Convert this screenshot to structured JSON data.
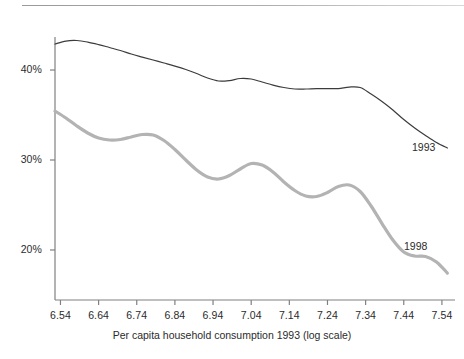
{
  "chart_data": {
    "type": "line",
    "title": "",
    "xlabel": "Per capita household consumption 1993 (log scale)",
    "ylabel": "",
    "xlim": [
      6.5257,
      7.5743
    ],
    "ylim": [
      0.1444,
      0.4367
    ],
    "grid": false,
    "legend": "inline-right",
    "y_tick_labels": [
      "40%",
      "30%",
      "20%"
    ],
    "y_tick_values": [
      0.4,
      0.3,
      0.2
    ],
    "x_tick_labels": [
      "6.54",
      "6.64",
      "6.74",
      "6.84",
      "6.94",
      "7.04",
      "7.14",
      "7.24",
      "7.34",
      "7.44",
      "7.54"
    ],
    "x_tick_values": [
      6.54,
      6.64,
      6.74,
      6.84,
      6.94,
      7.04,
      7.14,
      7.24,
      7.34,
      7.44,
      7.54
    ],
    "series": [
      {
        "name": "1993",
        "color": "#3c3c3c",
        "width": 1.2,
        "label_text": "1993",
        "x": [
          6.5257,
          6.5543,
          6.5829,
          6.6114,
          6.64,
          6.6686,
          6.6971,
          6.7257,
          6.7543,
          6.7829,
          6.8114,
          6.84,
          6.8686,
          6.8971,
          6.9257,
          6.9543,
          6.9829,
          7.0114,
          7.04,
          7.0686,
          7.0971,
          7.1257,
          7.1543,
          7.1829,
          7.2114,
          7.24,
          7.2686,
          7.2971,
          7.3257,
          7.3543,
          7.3829,
          7.4114,
          7.44,
          7.4686,
          7.4971,
          7.5257,
          7.5543
        ],
        "y": [
          0.4289,
          0.4322,
          0.4328,
          0.4311,
          0.4283,
          0.425,
          0.4217,
          0.4178,
          0.4144,
          0.4111,
          0.4078,
          0.4044,
          0.4006,
          0.3961,
          0.3911,
          0.3878,
          0.3883,
          0.3906,
          0.39,
          0.3867,
          0.3833,
          0.3806,
          0.3789,
          0.3789,
          0.3794,
          0.3794,
          0.3794,
          0.3811,
          0.3806,
          0.3733,
          0.365,
          0.3556,
          0.345,
          0.3356,
          0.3272,
          0.3194,
          0.3133
        ],
        "label_x": 7.3543,
        "label_y": 0.3244
      },
      {
        "name": "1998",
        "color": "#b3b3b3",
        "width": 3.2,
        "label_text": "1998",
        "x": [
          6.5257,
          6.5543,
          6.5829,
          6.6114,
          6.64,
          6.6686,
          6.6971,
          6.7257,
          6.7543,
          6.7829,
          6.8114,
          6.84,
          6.8686,
          6.8971,
          6.9257,
          6.9543,
          6.9829,
          7.0114,
          7.04,
          7.0686,
          7.0971,
          7.1257,
          7.1543,
          7.1829,
          7.2114,
          7.24,
          7.2686,
          7.2971,
          7.3257,
          7.3543,
          7.3829,
          7.4114,
          7.44,
          7.4686,
          7.4971,
          7.5257,
          7.5543
        ],
        "y": [
          0.3544,
          0.3467,
          0.3378,
          0.33,
          0.3244,
          0.3222,
          0.3228,
          0.3256,
          0.3283,
          0.3278,
          0.3217,
          0.3117,
          0.3,
          0.2889,
          0.2811,
          0.2789,
          0.2828,
          0.29,
          0.2961,
          0.2944,
          0.2867,
          0.2756,
          0.2661,
          0.26,
          0.2594,
          0.2639,
          0.2706,
          0.2722,
          0.265,
          0.2489,
          0.2294,
          0.2111,
          0.1978,
          0.1933,
          0.1928,
          0.1867,
          0.1744
        ]
      }
    ]
  },
  "axis": {
    "x_title": "Per capita household consumption 1993 (log scale)"
  },
  "ticks": {
    "y": [
      {
        "label": "40%",
        "value": 0.4
      },
      {
        "label": "30%",
        "value": 0.3
      },
      {
        "label": "20%",
        "value": 0.2
      }
    ],
    "x": [
      {
        "label": "6.54",
        "value": 6.54
      },
      {
        "label": "6.64",
        "value": 6.64
      },
      {
        "label": "6.74",
        "value": 6.74
      },
      {
        "label": "6.84",
        "value": 6.84
      },
      {
        "label": "6.94",
        "value": 6.94
      },
      {
        "label": "7.04",
        "value": 7.04
      },
      {
        "label": "7.14",
        "value": 7.14
      },
      {
        "label": "7.24",
        "value": 7.24
      },
      {
        "label": "7.34",
        "value": 7.34
      },
      {
        "label": "7.44",
        "value": 7.44
      },
      {
        "label": "7.54",
        "value": 7.54
      }
    ]
  },
  "series_labels": [
    {
      "text": "1993"
    },
    {
      "text": "1998"
    }
  ]
}
